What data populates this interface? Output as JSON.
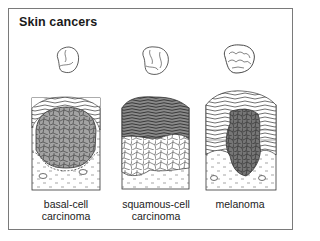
{
  "title": "Skin cancers",
  "panels": [
    {
      "id": "basal-cell",
      "label_line1": "basal-cell",
      "label_line2": "carcinoma"
    },
    {
      "id": "squamous-cell",
      "label_line1": "squamous-cell",
      "label_line2": "carcinoma"
    },
    {
      "id": "melanoma",
      "label_line1": "melanoma",
      "label_line2": ""
    }
  ],
  "colors": {
    "frame": "#7a7a7a",
    "ink": "#333333",
    "cell_gray": "#9a9a9a",
    "melanoma_dark": "#6e6e6e"
  }
}
